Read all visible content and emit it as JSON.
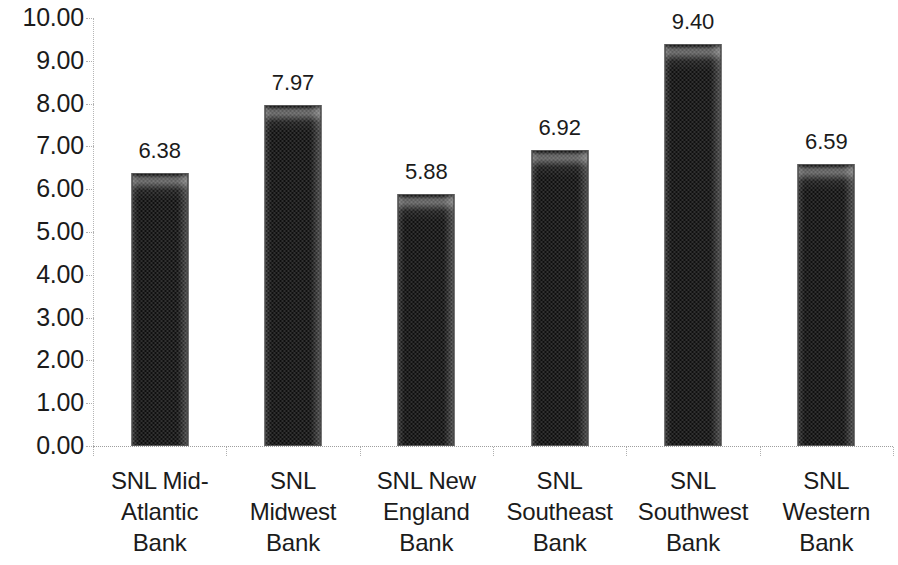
{
  "chart_data": {
    "type": "bar",
    "title": "",
    "subtitle": "",
    "xlabel": "",
    "ylabel": "",
    "categories": [
      "SNL Mid-Atlantic Bank",
      "SNL Midwest Bank",
      "SNL New England Bank",
      "SNL Southeast Bank",
      "SNL Southwest Bank",
      "SNL Western Bank"
    ],
    "category_lines": [
      [
        "SNL Mid-",
        "Atlantic",
        "Bank"
      ],
      [
        "SNL",
        "Midwest",
        "Bank"
      ],
      [
        "SNL New",
        "England",
        "Bank"
      ],
      [
        "SNL",
        "Southeast",
        "Bank"
      ],
      [
        "SNL",
        "Southwest",
        "Bank"
      ],
      [
        "SNL",
        "Western",
        "Bank"
      ]
    ],
    "values": [
      6.38,
      7.97,
      5.88,
      6.92,
      9.4,
      6.59
    ],
    "data_labels": [
      "6.38",
      "7.97",
      "5.88",
      "6.92",
      "9.40",
      "6.59"
    ],
    "ylim": [
      0,
      10
    ],
    "ytick_step": 1,
    "ytick_labels": [
      "10.00",
      "9.00",
      "8.00",
      "7.00",
      "6.00",
      "5.00",
      "4.00",
      "3.00",
      "2.00",
      "1.00",
      "0.00"
    ],
    "ytick_values": [
      10,
      9,
      8,
      7,
      6,
      5,
      4,
      3,
      2,
      1,
      0
    ],
    "grid": false,
    "legend": false,
    "legend_position": "none",
    "bar_color": "#2e2e2e",
    "bar_border_color": "#585858",
    "axis_color": "#b0b0b0",
    "text_color": "#1b1b1b",
    "background_color": "#ffffff"
  }
}
